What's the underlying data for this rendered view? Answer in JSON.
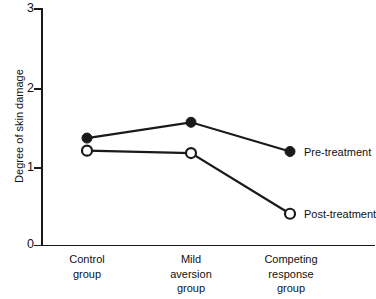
{
  "chart_data": {
    "type": "line",
    "title": "",
    "xlabel": "",
    "ylabel": "Degree of skin damage",
    "ylim": [
      0,
      3
    ],
    "ytick_labels": [
      "3",
      "2",
      "1",
      "0"
    ],
    "yticks": [
      3,
      2,
      1,
      0
    ],
    "grid": false,
    "legend_position": "inline-right",
    "categories": [
      "Control group",
      "Mild aversion group",
      "Competing response group"
    ],
    "category_lines": [
      [
        "Control",
        "group"
      ],
      [
        "Mild",
        "aversion",
        "group"
      ],
      [
        "Competing",
        "response",
        "group"
      ]
    ],
    "series": [
      {
        "name": "Pre-treatment",
        "marker": "filled-circle",
        "values": [
          1.35,
          1.55,
          1.18
        ]
      },
      {
        "name": "Post-treatment",
        "marker": "open-circle",
        "values": [
          1.19,
          1.16,
          0.39
        ]
      }
    ]
  },
  "colors": {
    "ink": "#1a1a1a",
    "background": "#ffffff"
  }
}
